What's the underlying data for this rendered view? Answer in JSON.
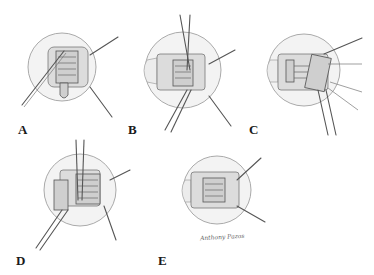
{
  "figure": {
    "panels": [
      {
        "id": "A",
        "label": "A",
        "description": "Hook under rectus muscle with tendon exposed"
      },
      {
        "id": "B",
        "label": "B",
        "description": "Suture placement through muscle with forceps"
      },
      {
        "id": "C",
        "label": "C",
        "description": "Clamp across muscle with multiple sutures"
      },
      {
        "id": "D",
        "label": "D",
        "description": "Muscle disinsertion with scissors and clamp"
      },
      {
        "id": "E",
        "label": "E",
        "description": "Reattached muscle with sutures tied"
      }
    ],
    "signature": "Anthony Pazos"
  }
}
